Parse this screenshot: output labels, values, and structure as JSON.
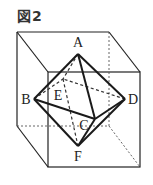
{
  "figure": {
    "title": "図2"
  },
  "vertices": {
    "A": {
      "label": "A",
      "x": 78,
      "y": 54,
      "lx": 78,
      "ly": 47
    },
    "B": {
      "label": "B",
      "x": 34,
      "y": 99,
      "lx": 26,
      "ly": 104
    },
    "C": {
      "label": "C",
      "x": 95,
      "y": 119,
      "lx": 84,
      "ly": 130
    },
    "D": {
      "label": "D",
      "x": 125,
      "y": 99,
      "lx": 132,
      "ly": 104
    },
    "E": {
      "label": "E",
      "x": 63,
      "y": 79,
      "lx": 58,
      "ly": 100
    },
    "F": {
      "label": "F",
      "x": 78,
      "y": 146,
      "lx": 78,
      "ly": 161
    }
  },
  "cube": {
    "front_face": {
      "x1": 48,
      "y1": 72,
      "x2": 140,
      "y2": 167
    },
    "back_face": {
      "x1": 17,
      "y1": 32,
      "x2": 109,
      "y2": 126
    }
  },
  "colors": {
    "stroke": "#222222",
    "hidden": "#444444",
    "background": "#ffffff"
  }
}
